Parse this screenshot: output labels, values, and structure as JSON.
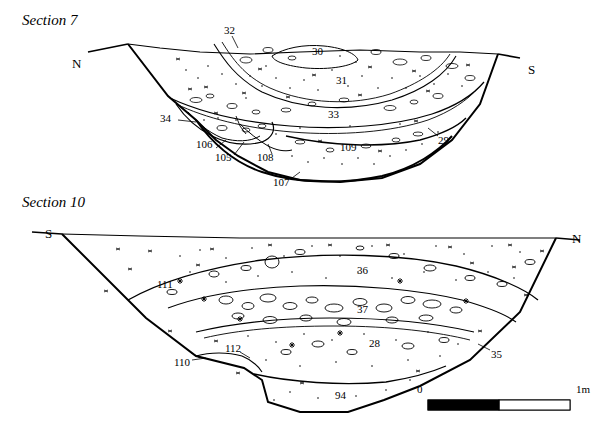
{
  "figure": {
    "sections": [
      {
        "title": "Section 7",
        "title_pos": [
          22,
          20
        ],
        "left_cardinal": "N",
        "right_cardinal": "S",
        "left_cardinal_pos": [
          72,
          56
        ],
        "right_cardinal_pos": [
          528,
          62
        ],
        "context_labels": [
          {
            "text": "32",
            "x": 224,
            "y": 30
          },
          {
            "text": "30",
            "x": 316,
            "y": 51
          },
          {
            "text": "31",
            "x": 339,
            "y": 80
          },
          {
            "text": "33",
            "x": 330,
            "y": 114
          },
          {
            "text": "34",
            "x": 164,
            "y": 117
          },
          {
            "text": "106",
            "x": 200,
            "y": 144
          },
          {
            "text": "105",
            "x": 219,
            "y": 157
          },
          {
            "text": "108",
            "x": 260,
            "y": 157
          },
          {
            "text": "109",
            "x": 342,
            "y": 147
          },
          {
            "text": "107",
            "x": 276,
            "y": 182
          },
          {
            "text": "29",
            "x": 440,
            "y": 140
          }
        ]
      },
      {
        "title": "Section 10",
        "title_pos": [
          22,
          201
        ],
        "left_cardinal": "S",
        "right_cardinal": "N",
        "left_cardinal_pos": [
          45,
          233
        ],
        "right_cardinal_pos": [
          572,
          238
        ],
        "context_labels": [
          {
            "text": "111",
            "x": 160,
            "y": 284
          },
          {
            "text": "36",
            "x": 360,
            "y": 270
          },
          {
            "text": "37",
            "x": 360,
            "y": 309
          },
          {
            "text": "28",
            "x": 372,
            "y": 343
          },
          {
            "text": "110",
            "x": 177,
            "y": 362
          },
          {
            "text": "112",
            "x": 228,
            "y": 348
          },
          {
            "text": "94",
            "x": 338,
            "y": 395
          },
          {
            "text": "35",
            "x": 494,
            "y": 354
          }
        ]
      }
    ],
    "scale_bar": {
      "zero_label": "0",
      "max_label": "1m",
      "zero_pos": [
        417,
        389
      ],
      "max_pos": [
        578,
        389
      ],
      "bar": {
        "x": 428,
        "y": 400,
        "width": 142,
        "height": 10
      },
      "fill_color": "#000000"
    }
  }
}
